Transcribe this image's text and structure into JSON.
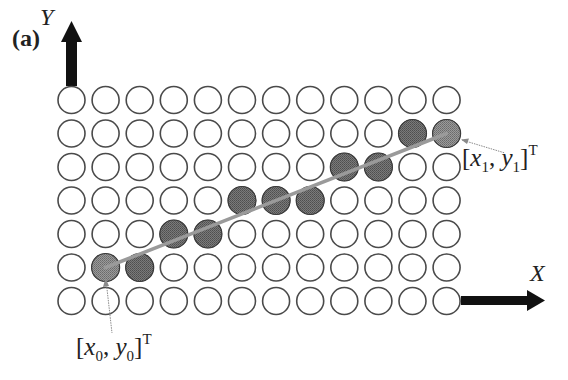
{
  "figure": {
    "panel_label": "(a)",
    "y_axis_label": "Y",
    "x_axis_label": "X",
    "grid": {
      "columns": 12,
      "rows": 7,
      "origin_x": 71.5,
      "origin_y": 100,
      "spacing_x": 34.1,
      "spacing_y": 33.5,
      "radius": 13.5,
      "empty_fill": "#ffffff",
      "stroke": "#4a4a4a",
      "filled_fill": "#6e6e6e",
      "endpoint_fill": "#8c8c8c"
    },
    "filled_cells": [
      {
        "row": 5,
        "col": 1,
        "endpoint": true
      },
      {
        "row": 5,
        "col": 2
      },
      {
        "row": 4,
        "col": 3
      },
      {
        "row": 4,
        "col": 4
      },
      {
        "row": 3,
        "col": 5
      },
      {
        "row": 3,
        "col": 6
      },
      {
        "row": 3,
        "col": 7
      },
      {
        "row": 2,
        "col": 8
      },
      {
        "row": 2,
        "col": 9
      },
      {
        "row": 1,
        "col": 10
      },
      {
        "row": 1,
        "col": 11,
        "endpoint": true
      }
    ],
    "line": {
      "from": {
        "row": 5,
        "col": 1
      },
      "to": {
        "row": 1,
        "col": 11
      },
      "color": "#9a9a9a"
    },
    "start_point": {
      "label_bracket_open": "[",
      "x_var": "x",
      "x_sub": "0",
      "sep": ", ",
      "y_var": "y",
      "y_sub": "0",
      "label_bracket_close": "]",
      "sup": "T"
    },
    "end_point": {
      "label_bracket_open": "[",
      "x_var": "x",
      "x_sub": "1",
      "sep": ", ",
      "y_var": "y",
      "y_sub": "1",
      "label_bracket_close": "]",
      "sup": "T"
    }
  }
}
